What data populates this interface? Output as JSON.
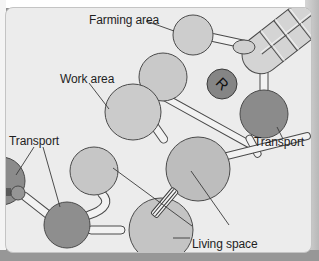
{
  "diagram": {
    "labels": {
      "farming_area": "Farming area",
      "work_area": "Work area",
      "transport_left": "Transport",
      "transport_right": "Transport",
      "living_space": "Living space",
      "robot_badge": "R"
    },
    "modules": [
      {
        "id": "farming-module",
        "type": "farming",
        "shape": "capsule-grid"
      },
      {
        "id": "farming-pod",
        "type": "pod"
      },
      {
        "id": "work-area-upper",
        "type": "work"
      },
      {
        "id": "work-area-main",
        "type": "work"
      },
      {
        "id": "robot-module",
        "type": "robot",
        "label": "R"
      },
      {
        "id": "transport-right",
        "type": "transport"
      },
      {
        "id": "central-hub",
        "type": "living"
      },
      {
        "id": "living-upper-left",
        "type": "living"
      },
      {
        "id": "living-space-main",
        "type": "living"
      },
      {
        "id": "transport-left-center",
        "type": "transport"
      },
      {
        "id": "transport-left-edge",
        "type": "transport"
      }
    ],
    "colors": {
      "panel_bg": "#ececec",
      "light_module": "#cfcfcf",
      "mid_module": "#bdbdbd",
      "dark_module": "#8b8b8b",
      "outline": "#4a4a4a",
      "tube": "#f2f2f2",
      "text": "#1e1e1e"
    }
  }
}
